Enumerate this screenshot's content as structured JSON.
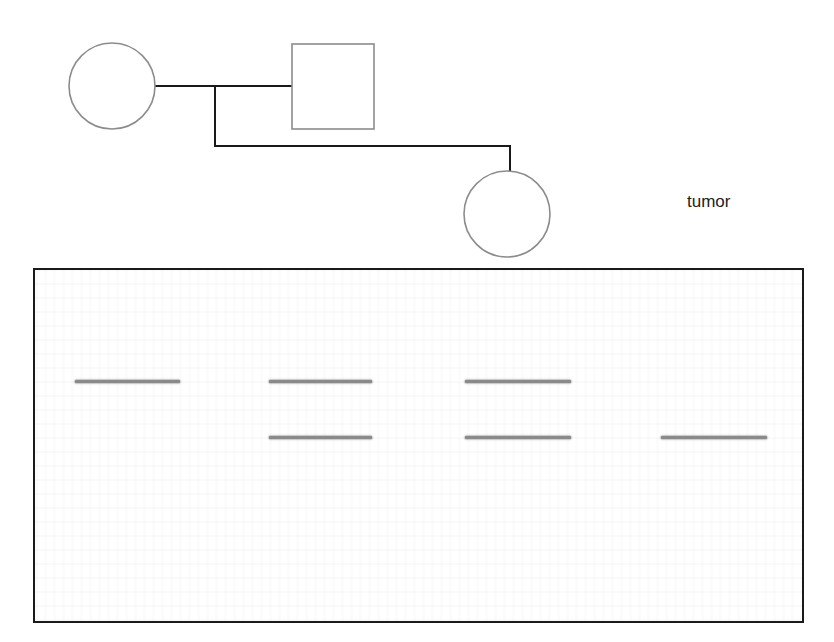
{
  "pedigree": {
    "parent_female": {
      "shape": "circle",
      "cx": 112,
      "cy": 86,
      "r": 43
    },
    "parent_male": {
      "shape": "square",
      "x": 292,
      "y": 44,
      "w": 82,
      "h": 85
    },
    "child_female": {
      "shape": "circle",
      "cx": 507,
      "cy": 214,
      "r": 43
    },
    "colors": {
      "symbol_stroke": "#8c8c8c",
      "line_stroke": "#1a1a1a"
    }
  },
  "labels": {
    "tumor": "tumor"
  },
  "gel": {
    "lanes": [
      {
        "name": "lane-1",
        "x": 40,
        "width": 105
      },
      {
        "name": "lane-2",
        "x": 234,
        "width": 103
      },
      {
        "name": "lane-3",
        "x": 430,
        "width": 106
      },
      {
        "name": "lane-4",
        "x": 626,
        "width": 106
      }
    ],
    "rows": [
      {
        "name": "upper-allele",
        "y": 110
      },
      {
        "name": "lower-allele",
        "y": 166
      }
    ],
    "bands": [
      {
        "lane": 0,
        "row": 0
      },
      {
        "lane": 1,
        "row": 0
      },
      {
        "lane": 2,
        "row": 0
      },
      {
        "lane": 1,
        "row": 1
      },
      {
        "lane": 2,
        "row": 1
      },
      {
        "lane": 3,
        "row": 1
      }
    ],
    "colors": {
      "band": "#8a8a8a",
      "border": "#1a1a1a"
    }
  }
}
